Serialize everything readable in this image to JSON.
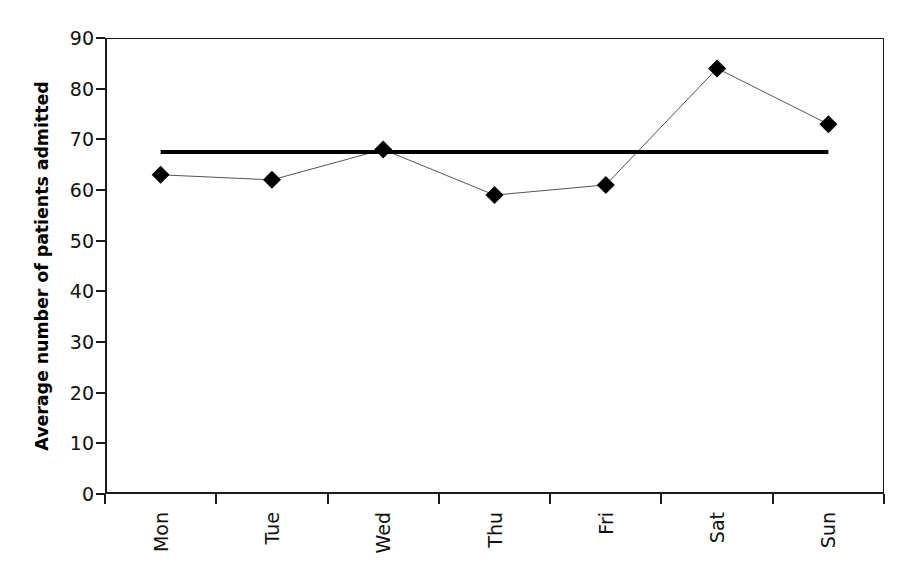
{
  "chart_data": {
    "type": "line",
    "title": "",
    "subtitle": "",
    "xlabel": "",
    "ylabel": "Average number of patients admitted",
    "categories": [
      "Mon",
      "Tue",
      "Wed",
      "Thu",
      "Fri",
      "Sat",
      "Sun"
    ],
    "series": [
      {
        "name": "Average number of patients admitted",
        "values": [
          63,
          62,
          68,
          59,
          61,
          84,
          73
        ],
        "marker": "filled-diamond",
        "marker_color": "#000000",
        "line_color": "#555555",
        "line_width": 1
      }
    ],
    "reference_line": {
      "name": "mean",
      "value": 67.5,
      "color": "#000000",
      "width": 4,
      "orientation": "horizontal",
      "spans_categories": [
        "Mon",
        "Sun"
      ]
    },
    "ylim": [
      0,
      90
    ],
    "yticks": [
      0,
      10,
      20,
      30,
      40,
      50,
      60,
      70,
      80,
      90
    ],
    "ytick_labels": [
      "0",
      "10",
      "20",
      "30",
      "40",
      "50",
      "60",
      "70",
      "80",
      "90"
    ],
    "xtick_labels": [
      "Mon",
      "Tue",
      "Wed",
      "Thu",
      "Fri",
      "Sat",
      "Sun"
    ],
    "xtick_label_rotation": 90,
    "grid": false,
    "legend": false,
    "legend_position": "none",
    "frame": true,
    "background_color": "#ffffff",
    "axis_color": "#1a1a1a"
  },
  "axes": {
    "y_title": "Average number of patients admitted",
    "y_ticks": [
      "90",
      "80",
      "70",
      "60",
      "50",
      "40",
      "30",
      "20",
      "10",
      "0"
    ],
    "x_ticks": [
      "Mon",
      "Tue",
      "Wed",
      "Thu",
      "Fri",
      "Sat",
      "Sun"
    ]
  }
}
